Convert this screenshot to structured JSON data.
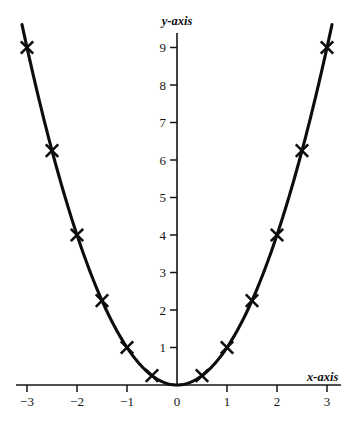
{
  "chart_data": {
    "type": "line",
    "title": "",
    "subtitle": "",
    "xlabel": "x-axis",
    "ylabel": "y-axis",
    "xlim": [
      -3.35,
      3.35
    ],
    "ylim": [
      0,
      9.6
    ],
    "grid": false,
    "legend": null,
    "x_ticks": [
      -3,
      -2,
      -1,
      0,
      1,
      2,
      3
    ],
    "x_tick_labels": [
      "−3",
      "−2",
      "−1",
      "0",
      "1",
      "2",
      "3"
    ],
    "y_ticks": [
      1,
      2,
      3,
      4,
      5,
      6,
      7,
      8,
      9
    ],
    "y_tick_labels": [
      "1",
      "2",
      "3",
      "4",
      "5",
      "6",
      "7",
      "8",
      "9"
    ],
    "series": [
      {
        "name": "y = x^2",
        "marker": "x-cross",
        "line_color": "#0d0d0d",
        "marker_color": "#0d0d0d",
        "x": [
          -3,
          -2.5,
          -2,
          -1.5,
          -1,
          -0.5,
          0,
          0.5,
          1,
          1.5,
          2,
          2.5,
          3
        ],
        "y": [
          9,
          6.25,
          4,
          2.25,
          1,
          0.25,
          0,
          0.25,
          1,
          2.25,
          4,
          6.25,
          9
        ]
      }
    ],
    "marked_points": [
      {
        "x": -3,
        "y": 9
      },
      {
        "x": -2.5,
        "y": 6.25
      },
      {
        "x": -2,
        "y": 4
      },
      {
        "x": -1.5,
        "y": 2.25
      },
      {
        "x": -1,
        "y": 1
      },
      {
        "x": -0.5,
        "y": 0.25
      },
      {
        "x": 0.5,
        "y": 0.25
      },
      {
        "x": 1,
        "y": 1
      },
      {
        "x": 1.5,
        "y": 2.25
      },
      {
        "x": 2,
        "y": 4
      },
      {
        "x": 2.5,
        "y": 6.25
      },
      {
        "x": 3,
        "y": 9
      }
    ],
    "curve_domain": [
      -3.1,
      3.1
    ],
    "colors": {
      "background": "#ffffff",
      "axis": "#141414",
      "curve": "#0d0d0d",
      "text": "#151515"
    }
  },
  "axes": {
    "x_axis_label": "x-axis",
    "y_axis_label": "y-axis",
    "origin_label": "0"
  }
}
